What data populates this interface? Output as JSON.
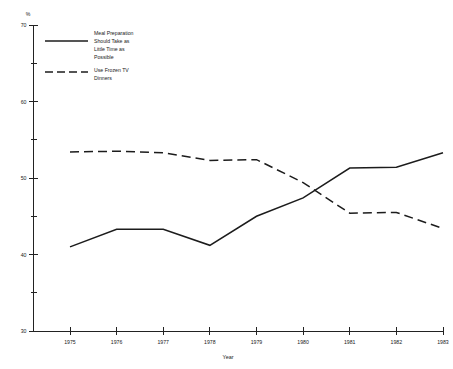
{
  "chart_data": {
    "type": "line",
    "title": "",
    "xlabel": "Year",
    "ylabel": "%",
    "yunit_label": "%",
    "categories": [
      "1975",
      "1976",
      "1977",
      "1978",
      "1979",
      "1980",
      "1981",
      "1982",
      "1983"
    ],
    "x": [
      1975,
      1976,
      1977,
      1978,
      1979,
      1980,
      1981,
      1982,
      1983
    ],
    "xlim": [
      1975,
      1983
    ],
    "ylim": [
      30,
      70
    ],
    "grid": false,
    "legend_position": "top-left-inside",
    "y_major_ticks": [
      30,
      40,
      50,
      60,
      70
    ],
    "y_minor_ticks": [
      35,
      45,
      55,
      65
    ],
    "y_tick_labels": [
      "30",
      "40",
      "50",
      "60",
      "70"
    ],
    "series": [
      {
        "name": "Meal Preparation Should Take as Little Time as Possible",
        "style": "solid",
        "color": "#1c1c1c",
        "values": [
          41.0,
          43.3,
          43.3,
          41.2,
          45.0,
          47.4,
          51.3,
          51.4,
          53.3
        ]
      },
      {
        "name": "Use Frozen TV Dinners",
        "style": "dashed",
        "color": "#1c1c1c",
        "values": [
          53.4,
          53.5,
          53.3,
          52.3,
          52.4,
          49.4,
          45.4,
          45.5,
          43.4
        ]
      }
    ]
  },
  "axes": {
    "y_unit": "%",
    "x_title": "Year"
  },
  "legend": {
    "entries": [
      {
        "style": "solid",
        "lines": [
          "Meal Preparation",
          "Should Take as",
          "Little Time as",
          "Possible"
        ]
      },
      {
        "style": "dashed",
        "lines": [
          "Use Frozen TV",
          "Dinners"
        ]
      }
    ]
  }
}
